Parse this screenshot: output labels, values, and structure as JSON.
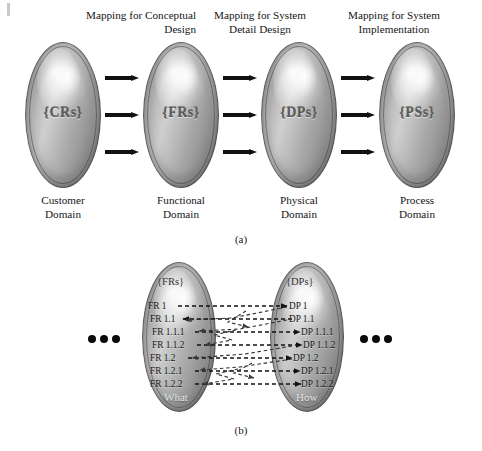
{
  "figure": {
    "part_a": {
      "caption": "(a)",
      "mappings": [
        {
          "id": "conceptual-design",
          "text": "Mapping for Conceptual\nDesign"
        },
        {
          "id": "system-detail-design",
          "text": "Mapping for System\nDetail Design"
        },
        {
          "id": "system-implementation",
          "text": "Mapping for System\nImplementation"
        }
      ],
      "domains": [
        {
          "id": "customer",
          "symbol": "{CRs}",
          "label": "Customer\nDomain"
        },
        {
          "id": "functional",
          "symbol": "{FRs}",
          "label": "Functional\nDomain"
        },
        {
          "id": "physical",
          "symbol": "{DPs}",
          "label": "Physical\nDomain"
        },
        {
          "id": "process",
          "symbol": "{PSs}",
          "label": "Process\nDomain"
        }
      ],
      "arrow_rows": 3
    },
    "part_b": {
      "caption": "(b)",
      "left": {
        "id": "frs",
        "symbol": "{FRs}",
        "footer": "What",
        "items": [
          "FR 1",
          "FR 1.1",
          "FR 1.1.1",
          "FR 1.1.2",
          "FR 1.2",
          "FR 1.2.1",
          "FR 1.2.2"
        ]
      },
      "right": {
        "id": "dps",
        "symbol": "{DPs}",
        "footer": "How",
        "items": [
          "DP 1",
          "DP 1.1",
          "DP 1.1.1",
          "DP 1.1.2",
          "DP 1.2",
          "DP 1.2.1",
          "DP 1.2.2"
        ]
      },
      "ellipsis_left": "•••",
      "ellipsis_right": "•••",
      "dot_count": 3
    }
  },
  "colors": {
    "ink": "#191919",
    "arrow": "#111111",
    "ellipse_light": "#cfcfcf",
    "ellipse_dark": "#6f6f6f",
    "footer_text": "#e8e8e8",
    "dot": "#090909"
  }
}
